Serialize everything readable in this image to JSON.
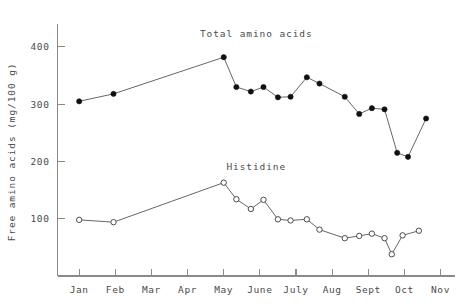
{
  "chart_data": {
    "type": "line",
    "title": "",
    "xlabel": "",
    "ylabel": "Free amino acids (mg/100 g)",
    "categories": [
      "Jan",
      "Feb",
      "Mar",
      "Apr",
      "May",
      "June",
      "July",
      "Aug",
      "Sept",
      "Oct",
      "Nov"
    ],
    "xtick_labels": [
      "Jan",
      "Feb",
      "Mar",
      "Apr",
      "May",
      "June",
      "July",
      "Aug",
      "Sept",
      "Oct",
      "Nov"
    ],
    "ytick_labels": [
      "400",
      "300",
      "200",
      "100"
    ],
    "ytick_values": [
      400,
      300,
      200,
      100
    ],
    "ylim": [
      0,
      440
    ],
    "xlim": [
      0.4,
      11.4
    ],
    "grid": false,
    "legend_position": "inline-annotations",
    "annotations": [
      {
        "text": "Total amino acids",
        "x": 5.9,
        "y": 418
      },
      {
        "text": "Histidine",
        "x": 5.9,
        "y": 185
      }
    ],
    "series": [
      {
        "name": "Total amino acids",
        "marker": "filled-circle",
        "color": "#111111",
        "points": [
          {
            "x": 1.0,
            "month": "Jan",
            "y": 305
          },
          {
            "x": 1.95,
            "month": "Feb",
            "y": 318
          },
          {
            "x": 5.0,
            "month": "May",
            "y": 382
          },
          {
            "x": 5.35,
            "month": "May",
            "y": 330
          },
          {
            "x": 5.75,
            "month": "June",
            "y": 322
          },
          {
            "x": 6.1,
            "month": "June",
            "y": 330
          },
          {
            "x": 6.5,
            "month": "July",
            "y": 312
          },
          {
            "x": 6.85,
            "month": "July",
            "y": 313
          },
          {
            "x": 7.3,
            "month": "Aug",
            "y": 347
          },
          {
            "x": 7.65,
            "month": "Aug",
            "y": 336
          },
          {
            "x": 8.35,
            "month": "Sept",
            "y": 313
          },
          {
            "x": 8.75,
            "month": "Sept",
            "y": 283
          },
          {
            "x": 9.1,
            "month": "Oct",
            "y": 293
          },
          {
            "x": 9.45,
            "month": "Oct",
            "y": 291
          },
          {
            "x": 9.8,
            "month": "Oct",
            "y": 215
          },
          {
            "x": 10.1,
            "month": "Nov",
            "y": 208
          },
          {
            "x": 10.6,
            "month": "Nov",
            "y": 275
          }
        ]
      },
      {
        "name": "Histidine",
        "marker": "open-circle",
        "color": "#4a4a4a",
        "points": [
          {
            "x": 1.0,
            "month": "Jan",
            "y": 98
          },
          {
            "x": 1.95,
            "month": "Feb",
            "y": 94
          },
          {
            "x": 5.0,
            "month": "May",
            "y": 163
          },
          {
            "x": 5.35,
            "month": "May",
            "y": 134
          },
          {
            "x": 5.75,
            "month": "June",
            "y": 117
          },
          {
            "x": 6.1,
            "month": "June",
            "y": 133
          },
          {
            "x": 6.5,
            "month": "July",
            "y": 99
          },
          {
            "x": 6.85,
            "month": "July",
            "y": 97
          },
          {
            "x": 7.3,
            "month": "Aug",
            "y": 99
          },
          {
            "x": 7.65,
            "month": "Aug",
            "y": 81
          },
          {
            "x": 8.35,
            "month": "Sept",
            "y": 66
          },
          {
            "x": 8.75,
            "month": "Sept",
            "y": 70
          },
          {
            "x": 9.1,
            "month": "Oct",
            "y": 74
          },
          {
            "x": 9.45,
            "month": "Oct",
            "y": 66
          },
          {
            "x": 9.65,
            "month": "Oct",
            "y": 38
          },
          {
            "x": 9.95,
            "month": "Nov",
            "y": 71
          },
          {
            "x": 10.4,
            "month": "Nov",
            "y": 79
          }
        ]
      }
    ]
  }
}
